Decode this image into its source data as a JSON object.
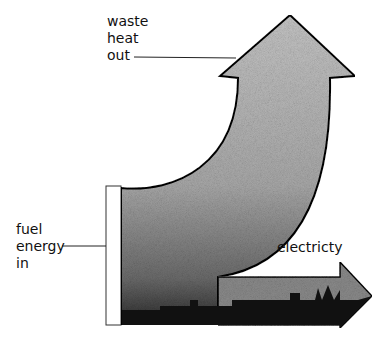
{
  "diagram": {
    "type": "sankey-energy-flow",
    "labels": {
      "waste_heat": [
        "waste",
        "heat",
        "out"
      ],
      "fuel_energy": [
        "fuel",
        "energy",
        "in"
      ],
      "electricity": "electricty"
    },
    "colors": {
      "fill_light": "#b8b8b8",
      "fill_dark": "#1a1a1a",
      "outline": "#000000",
      "input_bar": "#ffffff"
    }
  }
}
